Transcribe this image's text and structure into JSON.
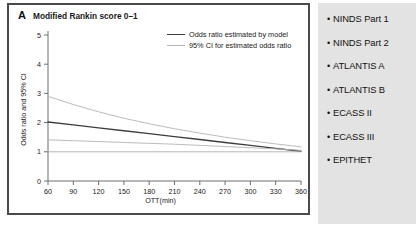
{
  "panel": {
    "letter": "A",
    "title": "Modified Rankin score 0–1"
  },
  "legend": {
    "position": "top-right",
    "entries": [
      {
        "label": "Odds ratio estimated by model",
        "style": "solid-dark",
        "color": "#3d3d3d"
      },
      {
        "label": "95% CI for estimated odds ratio",
        "style": "solid-light",
        "color": "#b3b3b3"
      }
    ]
  },
  "axes": {
    "y_label": "Odds ratio and 95% CI",
    "x_label": "OTT(min)",
    "y_ticks": [
      "0",
      "1",
      "2",
      "3",
      "4",
      "5"
    ],
    "x_ticks": [
      "60",
      "90",
      "120",
      "150",
      "180",
      "210",
      "240",
      "270",
      "300",
      "330",
      "360"
    ]
  },
  "trials": {
    "bullet": "•",
    "items": [
      {
        "label": "NINDS Part 1"
      },
      {
        "label": "NINDS Part 2"
      },
      {
        "label": "ATLANTIS A"
      },
      {
        "label": "ATLANTIS B"
      },
      {
        "label": "ECASS II"
      },
      {
        "label": "ECASS III"
      },
      {
        "label": "EPITHET"
      }
    ]
  },
  "colors": {
    "panel_border": "#4a4a4a",
    "list_background": "#e3e3e3",
    "axis": "#6e6e6e",
    "model_line": "#3d3d3d",
    "ci_line": "#b3b3b3",
    "reference_line": "#a8a8a8"
  },
  "chart_data": {
    "type": "line",
    "title": "Modified Rankin score 0–1",
    "xlabel": "OTT(min)",
    "ylabel": "Odds ratio and 95% CI",
    "xlim": [
      60,
      360
    ],
    "ylim": [
      0,
      5
    ],
    "grid": false,
    "legend_position": "top-right",
    "x": [
      60,
      90,
      120,
      150,
      180,
      210,
      240,
      270,
      300,
      330,
      360
    ],
    "series": [
      {
        "name": "95% CI upper for estimated odds ratio",
        "color": "#b3b3b3",
        "values": [
          2.9,
          2.62,
          2.37,
          2.15,
          1.96,
          1.79,
          1.64,
          1.5,
          1.38,
          1.27,
          1.17
        ]
      },
      {
        "name": "Odds ratio estimated by model",
        "color": "#3d3d3d",
        "values": [
          2.02,
          1.92,
          1.82,
          1.72,
          1.62,
          1.52,
          1.42,
          1.32,
          1.22,
          1.12,
          1.02
        ]
      },
      {
        "name": "95% CI lower for estimated odds ratio",
        "color": "#b3b3b3",
        "values": [
          1.41,
          1.38,
          1.35,
          1.32,
          1.29,
          1.26,
          1.22,
          1.18,
          1.14,
          1.1,
          1.05
        ]
      },
      {
        "name": "Reference line (odds ratio = 1)",
        "color": "#a8a8a8",
        "values": [
          1.0,
          1.0,
          1.0,
          1.0,
          1.0,
          1.0,
          1.0,
          1.0,
          1.0,
          1.0,
          1.0
        ]
      }
    ]
  }
}
